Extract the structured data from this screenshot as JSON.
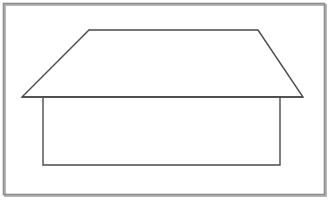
{
  "canvas": {
    "width": 330,
    "height": 203,
    "background_color": "#ffffff",
    "title": "House line drawing"
  },
  "style": {
    "stroke_color": "#4a4a4a",
    "frame_color": "#8c8c8c",
    "frame_shadow_color": "#b5b5b5",
    "fill_color": "#ffffff",
    "stroke_width": 1.4,
    "frame_stroke_width": 1.6
  },
  "figure": {
    "name": "house",
    "parts": [
      {
        "name": "frame",
        "shape": "rectangle",
        "x": 3.5,
        "y": 3.5,
        "width": 321,
        "height": 191,
        "filled": false
      },
      {
        "name": "roof",
        "shape": "trapezoid",
        "points": "89,30 258,30 303,97 22,97",
        "filled": false,
        "vertices": [
          {
            "label": "ridge-left",
            "x": 89,
            "y": 30
          },
          {
            "label": "ridge-right",
            "x": 258,
            "y": 30
          },
          {
            "label": "eave-right",
            "x": 303,
            "y": 97
          },
          {
            "label": "eave-left",
            "x": 22,
            "y": 97
          }
        ]
      },
      {
        "name": "wall",
        "shape": "rectangle",
        "points": "43,97 280,97 280,165 43,165",
        "x": 43,
        "y": 97,
        "width": 237,
        "height": 68,
        "filled": false,
        "vertices": [
          {
            "label": "top-left",
            "x": 43,
            "y": 97
          },
          {
            "label": "top-right",
            "x": 280,
            "y": 97
          },
          {
            "label": "bottom-right",
            "x": 280,
            "y": 165
          },
          {
            "label": "bottom-left",
            "x": 43,
            "y": 165
          }
        ]
      }
    ]
  }
}
